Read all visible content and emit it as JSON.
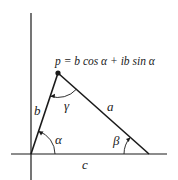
{
  "diagram": {
    "formula": "p = b cos α + ib sin α",
    "labels": {
      "side_a": "a",
      "side_b": "b",
      "side_c": "c",
      "angle_alpha": "α",
      "angle_beta": "β",
      "angle_gamma": "γ"
    },
    "points": {
      "origin": [
        31,
        154
      ],
      "p": [
        58,
        73
      ],
      "c_end": [
        149,
        154
      ]
    },
    "colors": {
      "stroke": "#1a1a1a",
      "background": "#ffffff"
    }
  }
}
